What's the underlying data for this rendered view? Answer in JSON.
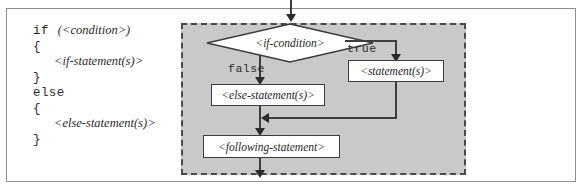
{
  "figure": {
    "code": {
      "lines": [
        {
          "keyword": "if",
          "placeholder": "(<condition>)",
          "indent": false
        },
        {
          "keyword": "{",
          "placeholder": "",
          "indent": false
        },
        {
          "keyword": "",
          "placeholder": "<if-statement(s)>",
          "indent": true
        },
        {
          "keyword": "}",
          "placeholder": "",
          "indent": false
        },
        {
          "keyword": "else",
          "placeholder": "",
          "indent": false
        },
        {
          "keyword": "{",
          "placeholder": "",
          "indent": false
        },
        {
          "keyword": "",
          "placeholder": "<else-statement(s)>",
          "indent": true
        },
        {
          "keyword": "}",
          "placeholder": "",
          "indent": false
        }
      ]
    },
    "flowchart": {
      "decision": "<if-condition>",
      "branch_true_label": "true",
      "branch_false_label": "false",
      "node_true": "<statement(s)>",
      "node_false": "<else-statement(s)>",
      "node_following": "<following-statement>",
      "region_fill": "#c9c9c9",
      "node_fill": "#ffffff",
      "line_color": "#3d3d3d"
    }
  }
}
